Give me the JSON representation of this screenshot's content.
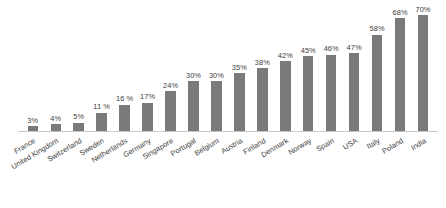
{
  "chart_data": {
    "type": "bar",
    "title": "",
    "xlabel": "",
    "ylabel": "",
    "ylim": [
      0,
      70
    ],
    "grid": false,
    "legend": null,
    "bar_color": "#7a7a7a",
    "axis_color": "#c8c8c8",
    "label_color": "#3d3d3d",
    "label_rotation": -31,
    "categories": [
      "France",
      "United Kingdom",
      "Switzerland",
      "Sweden",
      "Netherlands",
      "Germany",
      "Singapore",
      "Portugal",
      "Belgium",
      "Austria",
      "Finland",
      "Denmark",
      "Norway",
      "Spain",
      "USA",
      "Italy",
      "Poland",
      "India"
    ],
    "values": [
      3,
      4,
      5,
      11,
      16,
      17,
      24,
      30,
      30,
      35,
      38,
      42,
      45,
      46,
      47,
      58,
      68,
      70
    ],
    "value_labels": [
      "3%",
      "4%",
      "5%",
      "11 %",
      "16 %",
      "17%",
      "24%",
      "30%",
      "30%",
      "35%",
      "38%",
      "42%",
      "45%",
      "46%",
      "47%",
      "58%",
      "68%",
      "70%"
    ]
  }
}
